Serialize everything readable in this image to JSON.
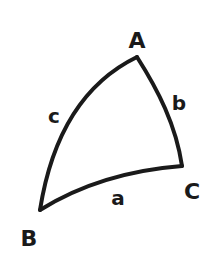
{
  "diagram": {
    "stroke_color": "#1a1a1a",
    "background_color": "#ffffff",
    "vertices": [
      {
        "id": "A",
        "label": "A",
        "point": [
          137,
          57
        ],
        "label_pos": [
          137,
          48
        ]
      },
      {
        "id": "B",
        "label": "B",
        "point": [
          40,
          210
        ],
        "label_pos": [
          29,
          246
        ]
      },
      {
        "id": "C",
        "label": "C",
        "point": [
          182,
          166
        ],
        "label_pos": [
          192,
          199
        ]
      }
    ],
    "sides": [
      {
        "id": "a",
        "label": "a",
        "from": "B",
        "to": "C",
        "label_pos": [
          118,
          205
        ]
      },
      {
        "id": "b",
        "label": "b",
        "from": "A",
        "to": "C",
        "label_pos": [
          179,
          110
        ]
      },
      {
        "id": "c",
        "label": "c",
        "from": "A",
        "to": "B",
        "label_pos": [
          54,
          123
        ]
      }
    ]
  }
}
